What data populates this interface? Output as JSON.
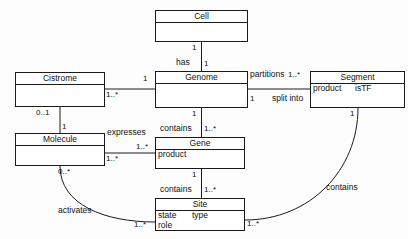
{
  "diagram": {
    "type": "uml-class-diagram",
    "stroke_color": "#1a1a1a",
    "background_color": "#fdfdfd",
    "classes": [
      {
        "id": "cell",
        "name": "Cell",
        "attributes": [],
        "x": 155,
        "y": 10,
        "w": 93,
        "h": 32
      },
      {
        "id": "cistrome",
        "name": "Cistrome",
        "attributes": [],
        "x": 15,
        "y": 72,
        "w": 90,
        "h": 35
      },
      {
        "id": "genome",
        "name": "Genome",
        "attributes": [],
        "x": 155,
        "y": 71,
        "w": 93,
        "h": 37
      },
      {
        "id": "segment",
        "name": "Segment",
        "attributes": [
          "product",
          "isTF"
        ],
        "x": 310,
        "y": 71,
        "w": 95,
        "h": 37
      },
      {
        "id": "molecule",
        "name": "Molecule",
        "attributes": [],
        "x": 15,
        "y": 133,
        "w": 90,
        "h": 33
      },
      {
        "id": "gene",
        "name": "Gene",
        "attributes": [
          "product"
        ],
        "x": 155,
        "y": 137,
        "w": 90,
        "h": 32
      },
      {
        "id": "site",
        "name": "Site",
        "attributes": [
          "state",
          "type",
          "role"
        ],
        "x": 155,
        "y": 198,
        "w": 90,
        "h": 33
      }
    ],
    "associations": [
      {
        "id": "cell-has-genome",
        "from": "cell",
        "to": "genome",
        "label": "has",
        "from_multiplicity": "1",
        "to_multiplicity": "1"
      },
      {
        "id": "cistrome-genome",
        "from": "cistrome",
        "to": "genome",
        "label": "",
        "from_multiplicity": "1..*",
        "to_multiplicity": "1"
      },
      {
        "id": "genome-partitions-segment",
        "from": "genome",
        "to": "segment",
        "label": "partitions",
        "from_multiplicity": "1",
        "to_multiplicity": "1..*",
        "secondary_label": "split into"
      },
      {
        "id": "cistrome-molecule",
        "from": "cistrome",
        "to": "molecule",
        "label": "",
        "from_multiplicity": "0..1",
        "to_multiplicity": "1"
      },
      {
        "id": "genome-contains-gene",
        "from": "genome",
        "to": "gene",
        "label": "contains",
        "from_multiplicity": "1",
        "to_multiplicity": "1..*"
      },
      {
        "id": "molecule-expresses-gene",
        "from": "molecule",
        "to": "gene",
        "label": "expresses",
        "from_multiplicity": "1..*",
        "to_multiplicity": "1..*"
      },
      {
        "id": "gene-contains-site",
        "from": "gene",
        "to": "site",
        "label": "contains",
        "from_multiplicity": "1",
        "to_multiplicity": "1..*"
      },
      {
        "id": "molecule-activates-site",
        "from": "molecule",
        "to": "site",
        "label": "activates",
        "from_multiplicity": "0..*",
        "to_multiplicity": "1..*"
      },
      {
        "id": "segment-contains-site",
        "from": "segment",
        "to": "site",
        "label": "contains",
        "from_multiplicity": "1",
        "to_multiplicity": "1..*"
      }
    ],
    "labels": {
      "has": "has",
      "partitions": "partitions",
      "split_into": "split into",
      "contains_genome_gene": "contains",
      "expresses": "expresses",
      "contains_gene_site": "contains",
      "activates": "activates",
      "contains_segment_site": "contains"
    },
    "multiplicities": {
      "cell_bottom": "1",
      "genome_top": "1",
      "cistrome_right": "1..*",
      "genome_left": "1",
      "genome_right_bottom": "1",
      "segment_left_top": "1..*",
      "cistrome_bottom": "0..1",
      "molecule_top": "1",
      "genome_bottom": "1",
      "gene_top": "1..*",
      "molecule_right_upper": "1..*",
      "gene_left": "1..*",
      "gene_bottom": "1",
      "site_top": "1..*",
      "molecule_bottom": "0..*",
      "site_left_bottom": "1..*",
      "segment_bottom": "1",
      "site_right_bottom": "1..*"
    }
  }
}
